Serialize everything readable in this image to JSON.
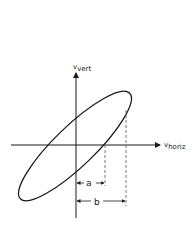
{
  "diagram": {
    "type": "lissajous-ellipse",
    "axes": {
      "vertical_label": {
        "main": "v",
        "sub": "vert"
      },
      "horizontal_label": {
        "main": "v",
        "sub": "horiz"
      }
    },
    "dimensions": [
      {
        "label": "a",
        "description": "distance from origin to ellipse x-axis crossing"
      },
      {
        "label": "b",
        "description": "distance from origin to ellipse max horizontal extent"
      }
    ],
    "colors": {
      "stroke": "#1a1a1a",
      "dashed": "#555555",
      "background": "#ffffff"
    }
  }
}
